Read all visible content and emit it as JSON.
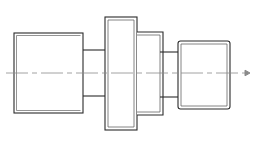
{
  "drawing": {
    "type": "engineering-elevation-view",
    "subject": "stepped-shaft-coupling",
    "canvas": {
      "width": 256,
      "height": 147,
      "background": "#ffffff"
    },
    "colors": {
      "outline": "#2b2b2b",
      "outline_secondary": "#555555",
      "centerline": "#8a8a8a",
      "background": "#ffffff"
    },
    "line_weights": {
      "outline": 1.1,
      "inner": 0.8,
      "centerline": 0.8
    },
    "centerline": {
      "label": "axis-of-revolution",
      "y": 73,
      "x_start": 6,
      "x_end": 250,
      "style": "dash-dot",
      "dash_pattern": "22 4 5 4",
      "arrow_end": "right"
    },
    "features": [
      {
        "name": "left-body",
        "label": "Left large cylinder",
        "x": 14,
        "y": 33,
        "width": 69,
        "height": 80,
        "inner_offset": 2.5,
        "has_inner_edge": true
      },
      {
        "name": "left-neck",
        "label": "Left reduced-diameter neck",
        "x": 83,
        "y": 50,
        "width": 29,
        "height": 46,
        "inner_offset": 0,
        "has_inner_edge": false
      },
      {
        "name": "center-flange",
        "label": "Central flange collar",
        "x": 105,
        "y": 17,
        "width": 32,
        "height": 113,
        "inner_offset": 3,
        "has_inner_edge": true
      },
      {
        "name": "mid-body",
        "label": "Intermediate cylinder",
        "x": 134,
        "y": 32,
        "width": 29,
        "height": 83,
        "inner_offset": 3,
        "has_inner_edge": true
      },
      {
        "name": "right-neck",
        "label": "Right reduced-diameter neck",
        "x": 160,
        "y": 52,
        "width": 24,
        "height": 45,
        "inner_offset": 0,
        "has_inner_edge": false
      },
      {
        "name": "right-body",
        "label": "Right cylinder end",
        "x": 178,
        "y": 41,
        "width": 52,
        "height": 68,
        "inner_offset": 3,
        "has_inner_edge": true
      }
    ]
  }
}
